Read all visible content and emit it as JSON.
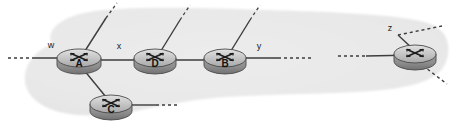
{
  "figure": {
    "type": "network-diagram",
    "background_color": "#ffffff",
    "cloud_fill": "#e9e9e9",
    "link_color": "#3d3d3d",
    "router_body_color": "#b4b4b4",
    "router_top_color": "#d4d4d4",
    "router_edge_color": "#5a5a5a",
    "label_color": "#1a1a1a"
  },
  "cloud": {
    "name": "isp-cloud",
    "label": ""
  },
  "routers": [
    {
      "id": "router-a",
      "label": "A",
      "cx": 79,
      "cy": 58,
      "rx": 22,
      "ry": 9,
      "depth": 7
    },
    {
      "id": "router-d",
      "label": "D",
      "cx": 155,
      "cy": 58,
      "rx": 21,
      "ry": 9,
      "depth": 7
    },
    {
      "id": "router-b",
      "label": "B",
      "cx": 225,
      "cy": 58,
      "rx": 21,
      "ry": 9,
      "depth": 7
    },
    {
      "id": "router-c",
      "label": "C",
      "cx": 111,
      "cy": 104,
      "rx": 21,
      "ry": 9,
      "depth": 7
    },
    {
      "id": "router-z-node",
      "label": "",
      "cx": 415,
      "cy": 54,
      "rx": 21,
      "ry": 9,
      "depth": 7
    }
  ],
  "edge_labels": [
    {
      "id": "label-w",
      "text": "w",
      "x": 51,
      "y": 48
    },
    {
      "id": "label-x",
      "text": "x",
      "x": 119,
      "y": 49
    },
    {
      "id": "label-y",
      "text": "y",
      "x": 259,
      "y": 49
    },
    {
      "id": "label-z",
      "text": "z",
      "x": 390,
      "y": 31
    }
  ],
  "links": [
    {
      "id": "link-dashed-west",
      "style": "dashed",
      "from": "edge-west",
      "to": "router-a"
    },
    {
      "id": "link-w-a",
      "style": "solid",
      "from": "edge-west",
      "to": "router-a"
    },
    {
      "id": "link-a-d",
      "style": "solid",
      "from": "router-a",
      "to": "router-d"
    },
    {
      "id": "link-d-b",
      "style": "solid",
      "from": "router-d",
      "to": "router-b"
    },
    {
      "id": "link-b-east",
      "style": "solid",
      "from": "router-b",
      "to": "edge-east"
    },
    {
      "id": "link-dashed-mid-1",
      "style": "dashed",
      "from": "router-b",
      "to": "gap"
    },
    {
      "id": "link-dashed-mid-2",
      "style": "dashed",
      "from": "gap",
      "to": "router-z-node"
    },
    {
      "id": "link-gap-z",
      "style": "solid",
      "from": "gap",
      "to": "router-z-node"
    },
    {
      "id": "link-a-c",
      "style": "solid",
      "from": "router-a",
      "to": "router-c"
    },
    {
      "id": "link-c-east",
      "style": "solid",
      "from": "router-c",
      "to": "stub"
    },
    {
      "id": "link-c-dashed",
      "style": "dashed",
      "from": "stub",
      "to": "outside"
    },
    {
      "id": "link-a-up",
      "style": "solid-then-dashed",
      "from": "router-a",
      "to": "outside-up"
    },
    {
      "id": "link-d-up",
      "style": "solid-then-dashed",
      "from": "router-d",
      "to": "outside-up"
    },
    {
      "id": "link-b-up",
      "style": "solid-then-dashed",
      "from": "router-b",
      "to": "outside-up"
    },
    {
      "id": "link-z-upright",
      "style": "dashed",
      "from": "router-z-node",
      "to": "outside-upright"
    },
    {
      "id": "link-z-downright",
      "style": "dashed",
      "from": "router-z-node",
      "to": "outside-downright"
    }
  ]
}
